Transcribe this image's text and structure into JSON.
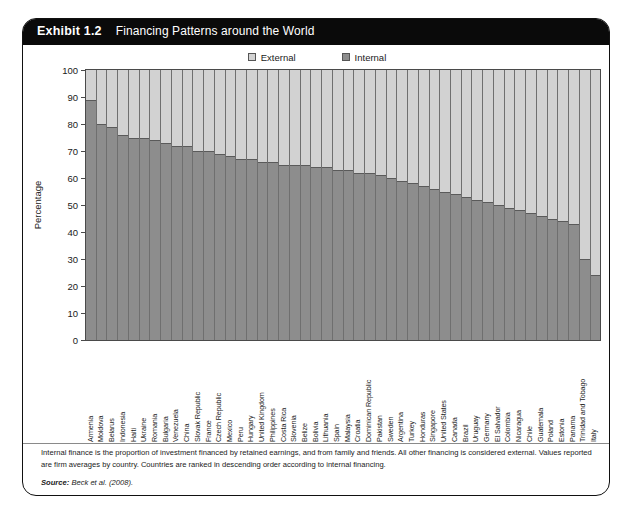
{
  "exhibit": {
    "number": "Exhibit 1.2",
    "title": "Financing Patterns around the World"
  },
  "legend": {
    "external": {
      "label": "External",
      "color": "#d2d2d2"
    },
    "internal": {
      "label": "Internal",
      "color": "#8d8d8d"
    }
  },
  "axis": {
    "y_title": "Percentage",
    "y_ticks": [
      "100",
      "90",
      "80",
      "70",
      "60",
      "50",
      "40",
      "30",
      "20",
      "10",
      "0"
    ]
  },
  "footnote": {
    "text": "Internal finance is the proportion of investment financed by retained earnings, and from family and friends. All other financing is considered external. Values reported are firm averages by country. Countries are ranked in descending order according to internal financing.",
    "source_label": "Source:",
    "source_value": "Beck et al. (2008)."
  },
  "chart_data": {
    "type": "bar",
    "stacked": true,
    "title": "Financing Patterns around the World",
    "xlabel": "",
    "ylabel": "Percentage",
    "ylim": [
      0,
      100
    ],
    "ytick_step": 10,
    "grid": false,
    "legend_position": "top-center",
    "categories": [
      "Armenia",
      "Moldova",
      "Belarus",
      "Indonesia",
      "Haiti",
      "Ukraine",
      "Romania",
      "Bulgaria",
      "Venezuela",
      "China",
      "Slovak Republic",
      "France",
      "Czech Republic",
      "Mexico",
      "Peru",
      "Hungary",
      "United Kingdom",
      "Philippines",
      "Costa Rica",
      "Slovenia",
      "Belize",
      "Bolivia",
      "Lithuania",
      "Spain",
      "Malaysia",
      "Croatia",
      "Dominican Republic",
      "Pakistan",
      "Sweden",
      "Argentina",
      "Turkey",
      "Honduras",
      "Singapore",
      "United States",
      "Canada",
      "Brazil",
      "Uruguay",
      "Germany",
      "El Salvador",
      "Colombia",
      "Nicaragua",
      "Chile",
      "Guatemala",
      "Poland",
      "Estonia",
      "Panama",
      "Trinidad and Tobago",
      "Italy"
    ],
    "series": [
      {
        "name": "Internal",
        "color": "#8d8d8d",
        "values": [
          89,
          80,
          79,
          76,
          75,
          75,
          74,
          73,
          72,
          72,
          70,
          70,
          69,
          68,
          67,
          67,
          66,
          66,
          65,
          65,
          65,
          64,
          64,
          63,
          63,
          62,
          62,
          61,
          60,
          59,
          58,
          57,
          56,
          55,
          54,
          53,
          52,
          51,
          50,
          49,
          48,
          47,
          46,
          45,
          44,
          43,
          30,
          24
        ]
      },
      {
        "name": "External",
        "color": "#d2d2d2",
        "values": [
          11,
          20,
          21,
          24,
          25,
          25,
          26,
          27,
          28,
          28,
          30,
          30,
          31,
          32,
          33,
          33,
          34,
          34,
          35,
          35,
          35,
          36,
          36,
          37,
          37,
          38,
          38,
          39,
          40,
          41,
          42,
          43,
          44,
          45,
          46,
          47,
          48,
          49,
          50,
          51,
          52,
          53,
          54,
          55,
          56,
          57,
          70,
          76
        ]
      }
    ]
  }
}
